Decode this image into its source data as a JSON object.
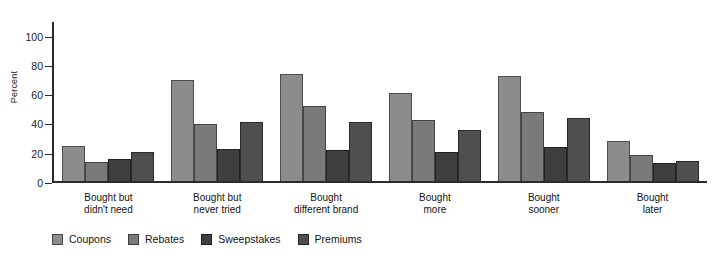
{
  "chart_data": {
    "type": "bar",
    "title": "",
    "subtitle": "",
    "xlabel": "",
    "ylabel": "Percent",
    "ylim": [
      0,
      110
    ],
    "yticks": [
      0,
      20,
      40,
      60,
      80,
      100
    ],
    "grid": false,
    "legend_position": "bottom-left",
    "orientation": "vertical",
    "grouping": "grouped",
    "categories": [
      "Bought but didn't need",
      "Bought but never tried",
      "Bought different brand",
      "Bought more",
      "Bought sooner",
      "Bought later"
    ],
    "category_lines": [
      [
        "Bought but",
        "didn't need"
      ],
      [
        "Bought but",
        "never tried"
      ],
      [
        "Bought",
        "different brand"
      ],
      [
        "Bought",
        "more"
      ],
      [
        "Bought",
        "sooner"
      ],
      [
        "Bought",
        "later"
      ]
    ],
    "series": [
      {
        "name": "Coupons",
        "color": "#8c8c8c",
        "values": [
          24,
          69,
          73,
          60,
          72,
          27
        ]
      },
      {
        "name": "Rebates",
        "color": "#7a7a7a",
        "values": [
          13,
          39,
          51,
          42,
          47,
          18
        ]
      },
      {
        "name": "Sweepstakes",
        "color": "#3f3f3f",
        "values": [
          15,
          22,
          21,
          20,
          23,
          12
        ]
      },
      {
        "name": "Premiums",
        "color": "#4f4f4f",
        "values": [
          20,
          40,
          40,
          35,
          43,
          14
        ]
      }
    ]
  },
  "axis": {
    "y_label": "Percent",
    "y_tick_labels": [
      "0",
      "20",
      "40",
      "60",
      "80",
      "100"
    ]
  },
  "legend": {
    "items": [
      {
        "label": "Coupons",
        "color": "#8c8c8c"
      },
      {
        "label": "Rebates",
        "color": "#7a7a7a"
      },
      {
        "label": "Sweepstakes",
        "color": "#3f3f3f"
      },
      {
        "label": "Premiums",
        "color": "#4f4f4f"
      }
    ]
  }
}
